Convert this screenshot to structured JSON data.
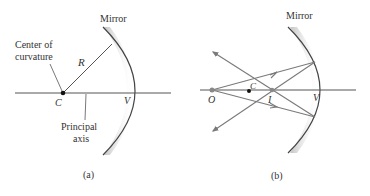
{
  "panel_a": {
    "mirror_label": "Mirror",
    "center_label_line1": "Center of",
    "center_label_line2": "curvature",
    "radius_label": "R",
    "center_point": "C",
    "vertex": "V",
    "axis_label_line1": "Principal",
    "axis_label_line2": "axis",
    "caption": "(a)"
  },
  "panel_b": {
    "mirror_label": "Mirror",
    "object_point": "O",
    "center_point": "C",
    "image_point": "I",
    "vertex": "V",
    "caption": "(b)"
  },
  "colors": {
    "line": "#555555",
    "ray": "#7a7a7a",
    "mirror": "#444444",
    "mirror_shade": "#cfcfcf",
    "text": "#333333"
  }
}
